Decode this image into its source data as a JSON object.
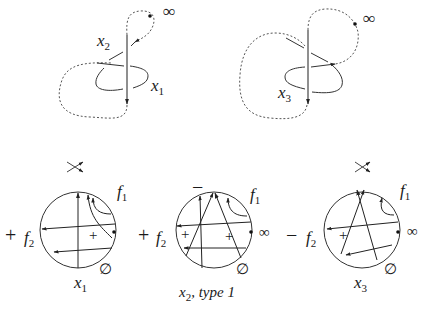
{
  "figure": {
    "colors": {
      "stroke": "#333333",
      "dashed": "#555555",
      "text": "#1a1a1a"
    },
    "top_knots": [
      {
        "id": "knot-left",
        "labels": [
          {
            "var": "x",
            "sub": "2"
          },
          {
            "var": "x",
            "sub": "1"
          }
        ],
        "marker": "∞"
      },
      {
        "id": "knot-right",
        "labels": [
          {
            "var": "x",
            "sub": "3"
          }
        ],
        "marker": "∞"
      }
    ],
    "chord_diagrams": [
      {
        "id": "term-1",
        "prefix_sign": "+",
        "crossing_icon": "crossing-icon",
        "f1": {
          "var": "f",
          "sub": "1"
        },
        "f2": {
          "var": "f",
          "sub": "2"
        },
        "inner_signs": [
          "+"
        ],
        "empty_set": "∅",
        "caption": {
          "var": "x",
          "sub": "1",
          "suffix": ""
        }
      },
      {
        "id": "term-2",
        "prefix_sign": "+",
        "top_sign": "−",
        "f1": {
          "var": "f",
          "sub": "1"
        },
        "f2": {
          "var": "f",
          "sub": "2"
        },
        "inner_signs": [
          "+",
          "+"
        ],
        "infinity": "∞",
        "empty_set": "∅",
        "caption": {
          "var": "x",
          "sub": "2",
          "suffix": ", type 1"
        }
      },
      {
        "id": "term-3",
        "prefix_sign": "−",
        "crossing_icon": "crossing-icon",
        "f1": {
          "var": "f",
          "sub": "1"
        },
        "f2": {
          "var": "f",
          "sub": "2"
        },
        "inner_signs": [
          "+"
        ],
        "infinity": "∞",
        "empty_set": "∅",
        "caption": {
          "var": "x",
          "sub": "3",
          "suffix": ""
        }
      }
    ]
  }
}
